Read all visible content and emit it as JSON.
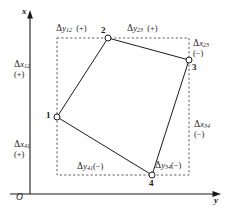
{
  "figure": {
    "axes": {
      "x_axis_label": "x",
      "y_axis_label": "y",
      "origin_label": "O"
    },
    "points": [
      {
        "id": "1",
        "label": "1",
        "x": 57,
        "y": 117
      },
      {
        "id": "2",
        "label": "2",
        "x": 108,
        "y": 38
      },
      {
        "id": "3",
        "label": "3",
        "x": 189,
        "y": 60
      },
      {
        "id": "4",
        "label": "4",
        "x": 152,
        "y": 175
      }
    ],
    "bounding_box": {
      "left": 57,
      "top": 38,
      "right": 189,
      "bottom": 175
    },
    "labels": [
      {
        "name": "delta-y-12",
        "delta": "Δ",
        "var": "y",
        "sub": "12",
        "sign": "(+)",
        "text": "Δy₁₂ (+)"
      },
      {
        "name": "delta-y-23",
        "delta": "Δ",
        "var": "y",
        "sub": "23",
        "sign": "(+)",
        "text": "Δy₂₃ (+)"
      },
      {
        "name": "delta-x-23",
        "delta": "Δ",
        "var": "x",
        "sub": "23",
        "sign": "(−)",
        "text": "Δx₂₃ (−)"
      },
      {
        "name": "delta-x-12",
        "delta": "Δ",
        "var": "x",
        "sub": "12",
        "sign": "(+)",
        "text": "Δx₁₂ (+)"
      },
      {
        "name": "delta-x-34",
        "delta": "Δ",
        "var": "x",
        "sub": "34",
        "sign": "(−)",
        "text": "Δx₃₄ (−)"
      },
      {
        "name": "delta-x-41",
        "delta": "Δ",
        "var": "x",
        "sub": "41",
        "sign": "(+)",
        "text": "Δx₄₁ (+)"
      },
      {
        "name": "delta-y-41",
        "delta": "Δ",
        "var": "y",
        "sub": "41",
        "sign": "(−)",
        "text": "Δy₄₁(−)"
      },
      {
        "name": "delta-y-34",
        "delta": "Δ",
        "var": "y",
        "sub": "34",
        "sign": "(−)",
        "text": "Δy₃₄(−)"
      }
    ],
    "colors": {
      "stroke": "#1a1a1a",
      "background": "#ffffff",
      "dash": "#4a4a4a"
    }
  }
}
